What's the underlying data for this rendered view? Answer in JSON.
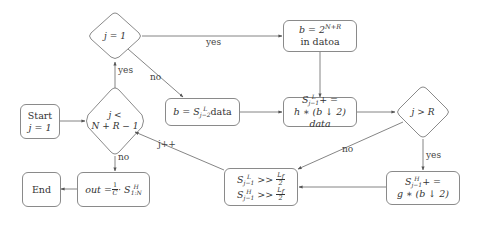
{
  "diagram": {
    "type": "flowchart",
    "nodes": {
      "start": {
        "line1": "Start",
        "line2": "j = 1"
      },
      "loop_check": {
        "line1": "j <",
        "line2": "N + R − 1"
      },
      "j_eq_1": {
        "label": "j = 1"
      },
      "b_init": {
        "line1": "b = 2",
        "line1_sup": "N+R",
        "line2": "in datoa"
      },
      "b_assign": {
        "prefix": "b = S",
        "sup": "L",
        "sub": "j−2",
        "suffix": " data"
      },
      "sl_update": {
        "line1_prefix": "S",
        "line1_sup": "L",
        "line1_sub": "j−1",
        "line1_suffix": "+ =",
        "line2": "h ∗ (b ↓ 2) data"
      },
      "j_gt_r": {
        "label": "j > R"
      },
      "sh_update": {
        "line1_prefix": "S",
        "line1_sup": "H",
        "line1_sub": "j−1",
        "line1_suffix": "+ =",
        "line2": "g ∗ (b ↓ 2)"
      },
      "shift": {
        "row1_prefix": "S",
        "row1_sup": "L",
        "row1_sub": "j−1",
        "row1_op": " >> ",
        "row2_prefix": "S",
        "row2_sup": "H",
        "row2_sub": "j−1",
        "row2_op": " >> ",
        "frac_num": "L",
        "frac_num_sub": "f",
        "frac_den": "2"
      },
      "output": {
        "prefix": "out = ",
        "frac_num": "1",
        "frac_den": "C",
        "mid": " · S",
        "sup": "H",
        "sub": "1:N"
      },
      "end": {
        "label": "End"
      }
    },
    "edge_labels": {
      "loop_yes": "yes",
      "loop_no": "no",
      "j1_yes": "yes",
      "j1_no": "no",
      "jr_yes": "yes",
      "jr_no": "no",
      "increment": "j++"
    },
    "colors": {
      "stroke": "#8a8a8a",
      "text": "#333333",
      "arrow": "#555555"
    }
  }
}
